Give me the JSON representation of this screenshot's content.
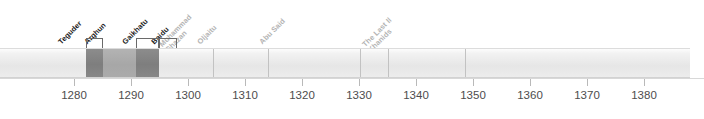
{
  "chart_data": {
    "type": "bar",
    "title": "",
    "xlabel": "",
    "ylabel": "",
    "orientation": "horizontal-timeline",
    "grid": false,
    "legend": "none",
    "xlim": [
      1272,
      1393
    ],
    "axis": {
      "tick_values": [
        1280,
        1290,
        1300,
        1310,
        1320,
        1330,
        1340,
        1350,
        1360,
        1370,
        1380
      ],
      "tick_labels": [
        "1280",
        "1290",
        "1300",
        "1310",
        "1320",
        "1330",
        "1340",
        "1350",
        "1360",
        "1370",
        "1380"
      ],
      "pixels_per_decade": 57,
      "origin_px": 74
    },
    "categories": [
      "Teguder",
      "Arghun",
      "Gaikhatu",
      "Baidu",
      "Muhammad Ghazan",
      "Oljaitu",
      "Abu Said",
      "The Last Il Khanids"
    ],
    "values": [
      {
        "name": "Teguder",
        "start": 1282,
        "end": 1284,
        "shade": "dark"
      },
      {
        "name": "Arghun",
        "start": 1284,
        "end": 1291,
        "shade": "mid"
      },
      {
        "name": "Gaikhatu",
        "start": 1291,
        "end": 1295,
        "shade": "dark"
      },
      {
        "name": "Baidu",
        "start": 1295,
        "end": 1295,
        "shade": "dark"
      },
      {
        "name": "Muhammad Ghazan",
        "start": 1295,
        "end": 1304,
        "shade": "light"
      },
      {
        "name": "Oljaitu",
        "start": 1304,
        "end": 1316,
        "shade": "light"
      },
      {
        "name": "Abu Said",
        "start": 1316,
        "end": 1335,
        "shade": "light"
      },
      {
        "name": "The Last Il Khanids",
        "start": 1335,
        "end": 1343,
        "shade": "light"
      }
    ]
  },
  "timeline": {
    "bar": {
      "left_px": 0,
      "width_px": 690,
      "top_px": 48,
      "height_px": 30
    },
    "segments": [
      {
        "key": "pre",
        "left": 0,
        "width": 86,
        "shade": "light"
      },
      {
        "key": "teguder",
        "left": 86,
        "width": 17,
        "shade": "dark"
      },
      {
        "key": "arghun",
        "left": 103,
        "width": 33,
        "shade": "mid"
      },
      {
        "key": "gaikhatu",
        "left": 136,
        "width": 23,
        "shade": "dark"
      },
      {
        "key": "post",
        "left": 159,
        "width": 531,
        "shade": "light"
      }
    ],
    "dividers_px": [
      213,
      268,
      360,
      388,
      465
    ],
    "leaders": [
      {
        "key": "teguder",
        "x": 86,
        "width": 17,
        "height": 10
      },
      {
        "key": "gaikhatu",
        "x": 136,
        "width": 23,
        "height": 10
      },
      {
        "key": "baidu",
        "x": 159,
        "width": 18,
        "height": 10
      }
    ],
    "labels": [
      {
        "key": "teguder",
        "text": "Teguder",
        "line2": "",
        "x": 63,
        "y": 47,
        "style": "bold"
      },
      {
        "key": "arghun",
        "text": "Arghun",
        "line2": "",
        "x": 89,
        "y": 47,
        "style": "bold"
      },
      {
        "key": "gaikhatu",
        "text": "Gaikhatu",
        "line2": "",
        "x": 127,
        "y": 47,
        "style": "bold"
      },
      {
        "key": "baidu",
        "text": "Baidu",
        "line2": "",
        "x": 156,
        "y": 47,
        "style": "bold"
      },
      {
        "key": "ghazan",
        "text": "Muhammad",
        "line2": "Ghazan",
        "x": 170,
        "y": 47,
        "style": "faint"
      },
      {
        "key": "oljaitu",
        "text": "Oljaitu",
        "line2": "",
        "x": 202,
        "y": 47,
        "style": "faint"
      },
      {
        "key": "abusaid",
        "text": "Abu Said",
        "line2": "",
        "x": 264,
        "y": 47,
        "style": "faint"
      },
      {
        "key": "lastil",
        "text": "The Last Il",
        "line2": "Khanids",
        "x": 373,
        "y": 47,
        "style": "faint"
      }
    ]
  }
}
